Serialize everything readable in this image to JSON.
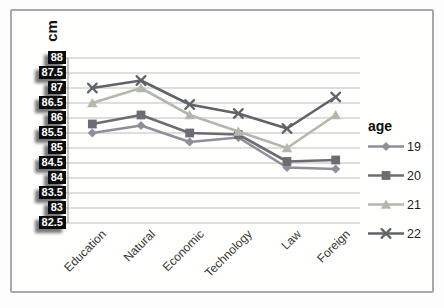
{
  "chart_data": {
    "type": "line",
    "title": "",
    "ylabel": "cm",
    "xlabel": "",
    "ylim": [
      82.5,
      88
    ],
    "ytick_step": 0.5,
    "y_tick_labels": [
      "88",
      "87.5",
      "87",
      "86.5",
      "86",
      "85.5",
      "85",
      "84.5",
      "84",
      "83.5",
      "83",
      "82.5"
    ],
    "grid": "horizontal",
    "legend_position": "right",
    "legend_title": "age",
    "categories": [
      "Education",
      "Natural",
      "Economic",
      "Technology",
      "Law",
      "Foreign"
    ],
    "series": [
      {
        "name": "19",
        "marker": "diamond",
        "color": "#8f8f99",
        "values": [
          85.5,
          85.75,
          85.2,
          85.35,
          84.35,
          84.3
        ]
      },
      {
        "name": "20",
        "marker": "square",
        "color": "#6f6b73",
        "values": [
          85.8,
          86.1,
          85.5,
          85.45,
          84.55,
          84.6
        ]
      },
      {
        "name": "21",
        "marker": "triangle",
        "color": "#b3b8ad",
        "values": [
          86.5,
          87.0,
          86.1,
          85.55,
          85.0,
          86.1
        ]
      },
      {
        "name": "22",
        "marker": "x",
        "color": "#5e6468",
        "values": [
          87.0,
          87.25,
          86.45,
          86.15,
          85.65,
          86.7
        ]
      }
    ],
    "colors": {
      "gridline": "#bdbdbd",
      "axis": "#9f9f9f",
      "tick_label_bg": "#0c0c0c",
      "tick_label_fg": "#ffffff",
      "frame_border": "#a8a8a8"
    }
  }
}
